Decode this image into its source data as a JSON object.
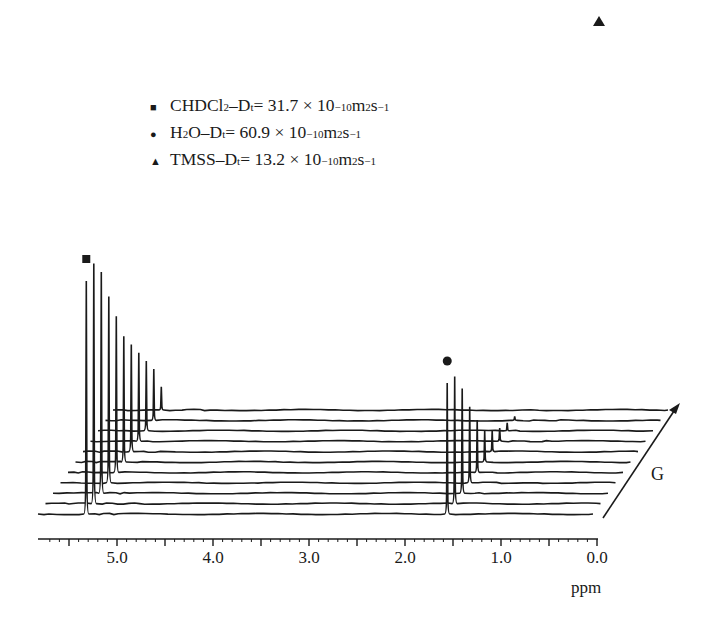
{
  "chart_data": {
    "type": "line",
    "subtype": "stacked pseudo-3D NMR diffusion (DOSY) spectra",
    "title": "",
    "xlabel": "ppm",
    "depth_label": "G",
    "x_range": [
      5.75,
      0.0
    ],
    "x_reversed": true,
    "x_ticks": [
      5.0,
      4.0,
      3.0,
      2.0,
      1.0,
      0.0
    ],
    "x_tick_labels": [
      "5.0",
      "4.0",
      "3.0",
      "2.0",
      "1.0",
      "0.0"
    ],
    "n_traces": 11,
    "peaks": [
      {
        "species": "CHDCl2",
        "marker": "square",
        "ppm": 5.32,
        "relative_heights": [
          1.0,
          1.03,
          0.95,
          0.8,
          0.67,
          0.54,
          0.46,
          0.38,
          0.3,
          0.22,
          0.1
        ]
      },
      {
        "species": "H2O",
        "marker": "circle",
        "ppm": 1.56,
        "relative_heights": [
          1.0,
          0.97,
          0.8,
          0.58,
          0.4,
          0.24,
          0.16,
          0.1,
          0.06,
          0.03,
          0.0
        ]
      },
      {
        "species": "TMSS",
        "marker": "triangle",
        "ppm": 0.0,
        "relative_heights": [
          1.0,
          0.98,
          0.93,
          0.8,
          0.73,
          0.62,
          0.49,
          0.26,
          0.12,
          0.05,
          0.02
        ]
      }
    ],
    "legend": [
      {
        "marker": "square",
        "species": "CHDCl2",
        "Dt": 31.7,
        "unit": "×10^-10 m^2 s^-1"
      },
      {
        "marker": "circle",
        "species": "H2O",
        "Dt": 60.9,
        "unit": "×10^-10 m^2 s^-1"
      },
      {
        "marker": "triangle",
        "species": "TMSS",
        "Dt": 13.2,
        "unit": "×10^-10 m^2 s^-1"
      }
    ],
    "grid": false,
    "legend_position": "upper-left"
  },
  "legend": {
    "rows": [
      {
        "marker": "■",
        "pre": "CHDCl",
        "sub1": "2",
        "mid": "–D",
        "sub2": "t",
        "value": " = 31.7 × 10",
        "exp": "−10",
        "unit_a": " m",
        "unit_exp1": "2",
        "unit_b": "s",
        "unit_exp2": "−1"
      },
      {
        "marker": "●",
        "pre": "H",
        "sub1": "2",
        "mid": "O–D",
        "sub2": "t",
        "value": " = 60.9 × 10",
        "exp": "−10",
        "unit_a": " m",
        "unit_exp1": "2",
        "unit_b": "s",
        "unit_exp2": "−1"
      },
      {
        "marker": "▲",
        "pre": "TMSS",
        "sub1": "",
        "mid": "–D",
        "sub2": "t",
        "value": " = 13.2 × 10",
        "exp": "−10",
        "unit_a": " m",
        "unit_exp1": "2",
        "unit_b": "s",
        "unit_exp2": "−1"
      }
    ]
  },
  "axis": {
    "ticks": [
      "5.0",
      "4.0",
      "3.0",
      "2.0",
      "1.0",
      "0.0"
    ],
    "unit": "ppm",
    "depth_label": "G"
  },
  "colors": {
    "ink": "#1a1a1a",
    "background": "#ffffff"
  }
}
